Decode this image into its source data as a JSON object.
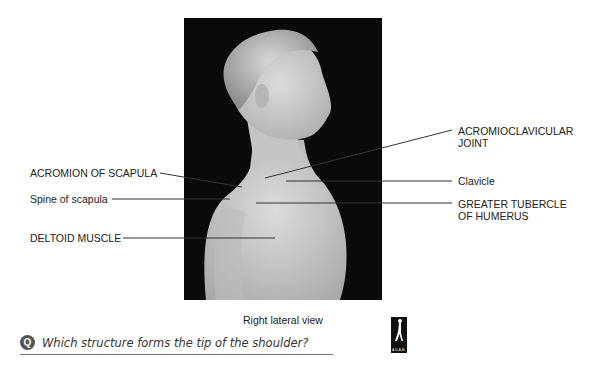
{
  "figure": {
    "view_caption": "Right lateral view",
    "labels_left": [
      {
        "id": "acromion",
        "text": "ACROMION OF SCAPULA"
      },
      {
        "id": "spine",
        "text": "Spine of scapula"
      },
      {
        "id": "deltoid",
        "text": "DELTOID MUSCLE"
      }
    ],
    "labels_right": [
      {
        "id": "ac_joint",
        "line1": "ACROMIOCLAVICULAR",
        "line2": "JOINT"
      },
      {
        "id": "clavicle",
        "line1": "Clavicle",
        "line2": ""
      },
      {
        "id": "greater_tubercle",
        "line1": "GREATER TUBERCLE",
        "line2": "OF HUMERUS"
      }
    ]
  },
  "question": {
    "icon": "Q",
    "text": "Which structure forms the tip of the shoulder?"
  },
  "logo": {
    "text": "A.D.A.M."
  },
  "colors": {
    "background": "#ffffff",
    "photo_bg": "#0a0a0a",
    "leader_line": "#333333",
    "skin": "#cfcfcf"
  }
}
